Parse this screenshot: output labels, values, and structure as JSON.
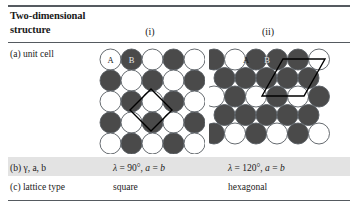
{
  "table": {
    "header": {
      "title": "Two-dimensional structure",
      "title_line1": "Two-dimensional",
      "title_line2": "structure",
      "col_i": "(i)",
      "col_ii": "(ii)"
    },
    "rows": [
      {
        "label": "(a) unit cell",
        "i": "square lattice packing diagram",
        "ii": "hexagonal lattice packing diagram"
      },
      {
        "label": "(b) γ, a, b",
        "i_lambda": "λ",
        "i_eq1": " = 90°, ",
        "i_a": "a",
        "i_eq2": " = ",
        "i_b": "b",
        "ii_lambda": "λ",
        "ii_eq1": " = 120°, ",
        "ii_a": "a",
        "ii_eq2": " = ",
        "ii_b": "b",
        "i_full": "λ = 90°, a = b",
        "ii_full": "λ = 120°, a = b"
      },
      {
        "label": "(c) lattice type",
        "i": "square",
        "ii": "hexagonal"
      }
    ]
  },
  "diagrams": {
    "square": {
      "caption": "square",
      "atom_a_label": "A",
      "atom_b_label": "B",
      "unit_cell_shape": "rotated-square",
      "rows": 5,
      "cols": 5,
      "pattern": "checkerboard",
      "colors": {
        "atom_a": "#ffffff",
        "atom_b": "#4a4a4a",
        "outline": "#555a60",
        "cell_edge": "#000000"
      }
    },
    "hexagonal": {
      "caption": "hexagonal",
      "atom_a_label": "A",
      "atom_b_label": "B",
      "unit_cell_shape": "rhombus-120",
      "rows": 5,
      "pattern": "close-packed-offset",
      "colors": {
        "atom_a": "#ffffff",
        "atom_b": "#4a4a4a",
        "outline": "#555a60",
        "cell_edge": "#000000"
      }
    }
  },
  "style": {
    "rule_color": "#555a60",
    "band_color": "#e3e3e3",
    "text_color": "#1a1a1a",
    "background": "#ffffff"
  }
}
